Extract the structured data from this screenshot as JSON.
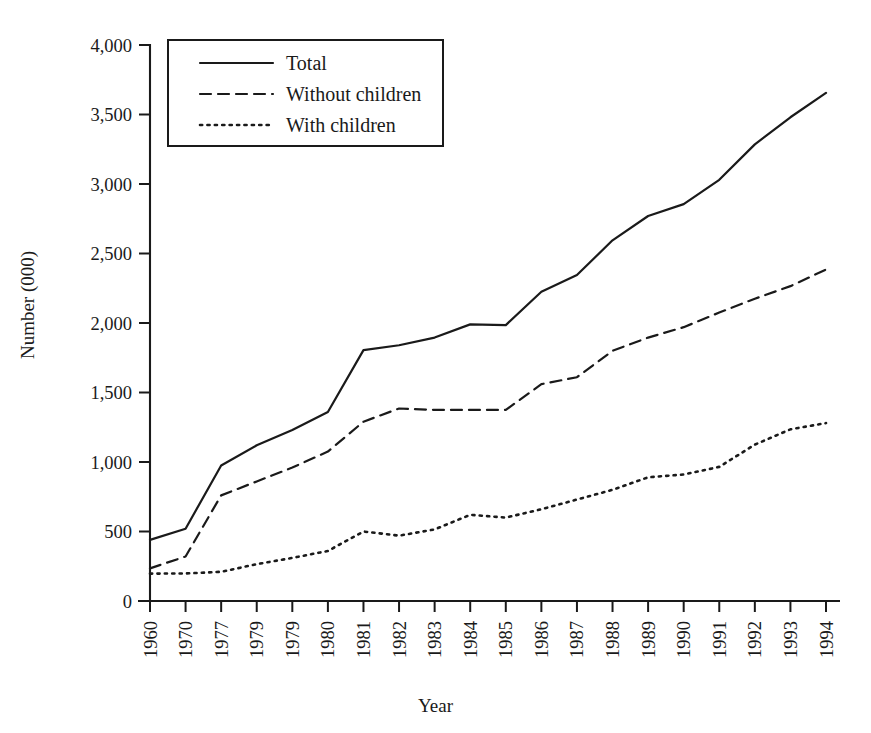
{
  "chart_data": {
    "type": "line",
    "title": "",
    "xlabel": "Year",
    "ylabel": "Number (000)",
    "ylim": [
      0,
      4000
    ],
    "ytick_labels": [
      "0",
      "500",
      "1,000",
      "1,500",
      "2,000",
      "2,500",
      "3,000",
      "3,500",
      "4,000"
    ],
    "ytick_values": [
      0,
      500,
      1000,
      1500,
      2000,
      2500,
      3000,
      3500,
      4000
    ],
    "grid": false,
    "legend_position": "top-left",
    "categories": [
      "1960",
      "1970",
      "1977",
      "1979",
      "1979",
      "1980",
      "1981",
      "1982",
      "1983",
      "1984",
      "1985",
      "1986",
      "1987",
      "1988",
      "1989",
      "1990",
      "1991",
      "1992",
      "1993",
      "1994"
    ],
    "series": [
      {
        "name": "Total",
        "style": "solid",
        "values": [
          440,
          520,
          975,
          1120,
          1230,
          1360,
          1805,
          1840,
          1895,
          1990,
          1985,
          2225,
          2345,
          2595,
          2770,
          2855,
          3030,
          3285,
          3480,
          3655
        ]
      },
      {
        "name": "Without children",
        "style": "dashed",
        "values": [
          235,
          320,
          760,
          860,
          960,
          1075,
          1290,
          1385,
          1375,
          1375,
          1375,
          1560,
          1610,
          1800,
          1895,
          1970,
          2075,
          2175,
          2265,
          2385
        ]
      },
      {
        "name": "With children",
        "style": "dotted",
        "values": [
          197,
          198,
          210,
          265,
          310,
          360,
          500,
          470,
          515,
          620,
          600,
          660,
          730,
          800,
          890,
          910,
          965,
          1125,
          1235,
          1280
        ]
      }
    ]
  },
  "legend": {
    "items": [
      {
        "label": "Total",
        "style": "solid"
      },
      {
        "label": "Without children",
        "style": "dashed"
      },
      {
        "label": "With children",
        "style": "dotted"
      }
    ]
  },
  "axes": {
    "y_title": "Number (000)",
    "x_title": "Year"
  }
}
